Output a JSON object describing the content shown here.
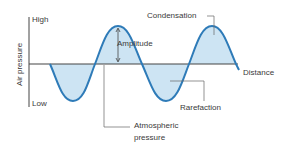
{
  "diagram": {
    "type": "sound-wave-pressure",
    "colors": {
      "wave_stroke": "#2e7bb8",
      "wave_fill": "#cde4f3",
      "axis": "#444444",
      "leader": "#555555",
      "text": "#3a3a3a"
    },
    "y_axis": {
      "label": "Air pressure",
      "high_label": "High",
      "low_label": "Low"
    },
    "x_axis": {
      "label": "Distance"
    },
    "annotations": {
      "amplitude": "Amplitude",
      "condensation": "Condensation",
      "rarefaction": "Rarefaction",
      "atmospheric_line1": "Atmospheric",
      "atmospheric_line2": "pressure"
    }
  }
}
